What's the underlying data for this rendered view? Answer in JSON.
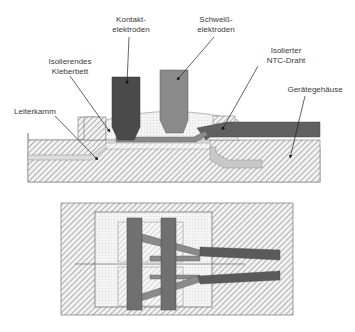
{
  "labels": {
    "kontakt": "Kontakt-\nelektroden",
    "schweiss": "Schweiß-\nelektroden",
    "kleberbett": "Isolierendes\nKleberbett",
    "ntc": "Isolierter\nNTC-Draht",
    "leiterkamm": "Leiterkamm",
    "gehaeuse": "Gerätegehäuse"
  },
  "colors": {
    "contact_electrode": "#4a4a4a",
    "weld_electrode": "#8a8a8a",
    "wire": "#606060",
    "conductor": "#c8c8c8",
    "hatch_line": "#7a7a7a",
    "label_text": "#3a3a3a"
  },
  "views": {
    "top": "cross-section",
    "bottom": "plan-view"
  }
}
